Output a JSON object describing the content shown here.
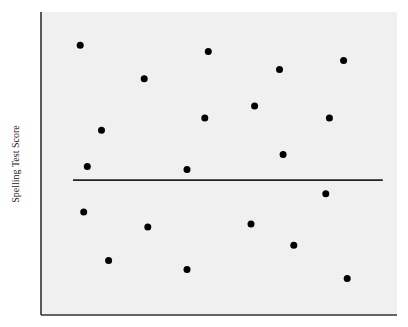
{
  "chart_data": {
    "type": "scatter",
    "title": "",
    "xlabel": "",
    "ylabel": "Spelling Test Score",
    "grid": false,
    "legend": null,
    "x_ticks": [],
    "y_ticks": [],
    "xlim": [
      0,
      100
    ],
    "ylim": [
      0,
      100
    ],
    "reference_line": {
      "orientation": "horizontal",
      "y": 44.5,
      "x_start": 9,
      "x_end": 96,
      "description": "Horizontal line (mean score) across the plot"
    },
    "points": [
      {
        "x": 11,
        "y": 89
      },
      {
        "x": 29,
        "y": 78
      },
      {
        "x": 47,
        "y": 87
      },
      {
        "x": 17,
        "y": 61
      },
      {
        "x": 13,
        "y": 49
      },
      {
        "x": 46,
        "y": 65
      },
      {
        "x": 60,
        "y": 69
      },
      {
        "x": 67,
        "y": 81
      },
      {
        "x": 85,
        "y": 84
      },
      {
        "x": 41,
        "y": 48
      },
      {
        "x": 68,
        "y": 53
      },
      {
        "x": 81,
        "y": 65
      },
      {
        "x": 12,
        "y": 34
      },
      {
        "x": 30,
        "y": 29
      },
      {
        "x": 19,
        "y": 18
      },
      {
        "x": 41,
        "y": 15
      },
      {
        "x": 59,
        "y": 30
      },
      {
        "x": 71,
        "y": 23
      },
      {
        "x": 80,
        "y": 40
      },
      {
        "x": 86,
        "y": 12
      }
    ],
    "marker": {
      "shape": "circle",
      "color": "#000000",
      "radius": 3.5
    },
    "colors": {
      "plot_background": "#f0f0f0",
      "axis": "#333333",
      "reference_line": "#222222"
    }
  },
  "labels": {
    "ylabel": "Spelling Test Score"
  }
}
